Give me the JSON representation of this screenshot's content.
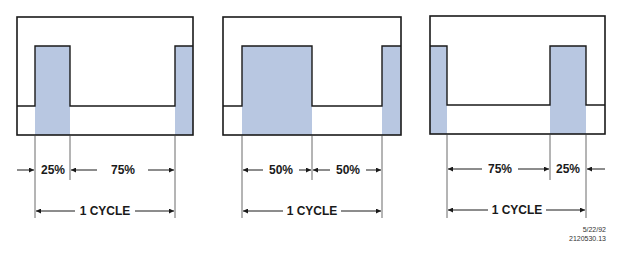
{
  "colors": {
    "pulse_fill": "#b8c7e1",
    "stroke": "#1a1a1a",
    "background": "#ffffff"
  },
  "panels": [
    {
      "duty_cycle": "25%",
      "high_label": "25%",
      "low_label": "75%",
      "cycle_label": "1 CYCLE",
      "order": "high-then-low"
    },
    {
      "duty_cycle": "50%",
      "high_label": "50%",
      "low_label": "50%",
      "cycle_label": "1 CYCLE",
      "order": "high-then-low"
    },
    {
      "duty_cycle": "25%",
      "high_label": "25%",
      "low_label": "75%",
      "cycle_label": "1 CYCLE",
      "order": "low-then-high"
    }
  ],
  "footer": {
    "date": "5/22/92",
    "code": "2120530.13"
  }
}
